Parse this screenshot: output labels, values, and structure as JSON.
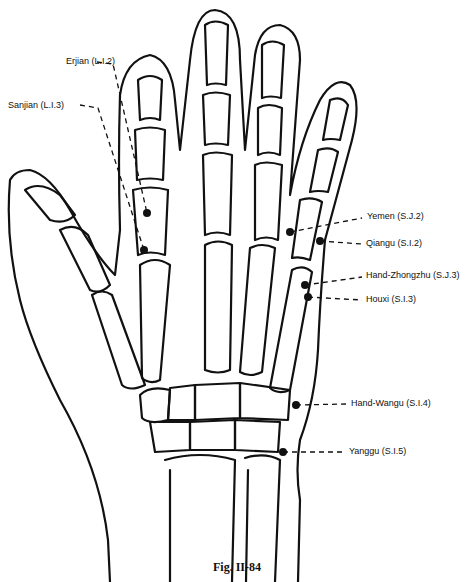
{
  "figure": {
    "caption": "Fig. II-84",
    "points": [
      {
        "id": "erjian",
        "label": "Erjian (L.I.2)",
        "x": 147,
        "y": 213,
        "label_x": 66,
        "label_y": 62
      },
      {
        "id": "sanjian",
        "label": "Sanjian (L.I.3)",
        "x": 144,
        "y": 250,
        "label_x": 8,
        "label_y": 97
      },
      {
        "id": "yemen",
        "label": "Yemen (S.J.2)",
        "x": 290,
        "y": 232,
        "label_x": 367,
        "label_y": 214
      },
      {
        "id": "qiangu",
        "label": "Qiangu (S.I.2)",
        "x": 320,
        "y": 241,
        "label_x": 366,
        "label_y": 240
      },
      {
        "id": "hand-zhongzhu",
        "label": "Hand-Zhongzhu (S.J.3)",
        "x": 305,
        "y": 285,
        "label_x": 366,
        "label_y": 273
      },
      {
        "id": "houxi",
        "label": "Houxi (S.I.3)",
        "x": 308,
        "y": 297,
        "label_x": 366,
        "label_y": 296
      },
      {
        "id": "hand-wangu",
        "label": "Hand-Wangu (S.I.4)",
        "x": 296,
        "y": 405,
        "label_x": 351,
        "label_y": 400
      },
      {
        "id": "yanggu",
        "label": "Yanggu (S.I.5)",
        "x": 283,
        "y": 452,
        "label_x": 349,
        "label_y": 448
      }
    ]
  }
}
